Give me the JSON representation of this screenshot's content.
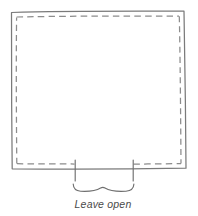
{
  "diagram": {
    "type": "sewing-pattern-illustration",
    "background_color": "#ffffff",
    "fabric_outline": {
      "name": "fabric-panel-outline",
      "style": "solid",
      "color": "#7a7a7a",
      "stroke_width": 1.2,
      "points": "11,12 184,11 186,168 12,169"
    },
    "stitch_line": {
      "name": "stitching-line",
      "style": "dashed",
      "color": "#8c8c8c",
      "stroke_width": 1.2,
      "dash_pattern": "6 4",
      "inset": 5,
      "gap_description": "stitching interrupted along bottom edge between the two tick marks"
    },
    "opening_marks": {
      "name": "opening-tick-marks",
      "color": "#6f6f6f",
      "left_x": 75,
      "right_x": 133,
      "top_y": 160,
      "bottom_y": 181
    },
    "brace": {
      "name": "opening-brace",
      "color": "#6f6f6f",
      "left_x": 73,
      "right_x": 134,
      "y": 185,
      "orientation": "down"
    },
    "caption": {
      "name": "leave-open-caption",
      "text": "Leave open",
      "color": "#4a4a4a",
      "font_size": "10.5px",
      "font_style": "italic",
      "center_x": 103,
      "baseline_y": 208
    }
  }
}
